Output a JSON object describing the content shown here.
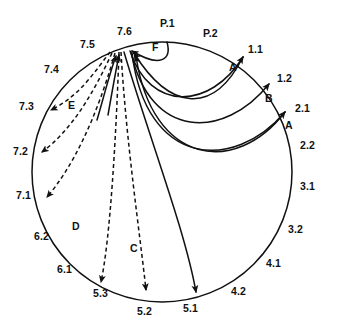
{
  "diagram": {
    "type": "circular-connection-diagram",
    "background_color": "#ffffff",
    "stroke_color": "#111111",
    "circle": {
      "cx": 162,
      "cy": 172,
      "r": 130
    },
    "rim_labels": [
      {
        "id": "P.1",
        "text": "P.1",
        "x": 160,
        "y": 18
      },
      {
        "id": "P.2",
        "text": "P.2",
        "x": 203,
        "y": 28
      },
      {
        "id": "1.1",
        "text": "1.1",
        "x": 248,
        "y": 44
      },
      {
        "id": "1.2",
        "text": "1.2",
        "x": 277,
        "y": 73
      },
      {
        "id": "2.1",
        "text": "2.1",
        "x": 295,
        "y": 103
      },
      {
        "id": "2.2",
        "text": "2.2",
        "x": 300,
        "y": 140
      },
      {
        "id": "3.1",
        "text": "3.1",
        "x": 300,
        "y": 181
      },
      {
        "id": "3.2",
        "text": "3.2",
        "x": 288,
        "y": 224
      },
      {
        "id": "4.1",
        "text": "4.1",
        "x": 266,
        "y": 258
      },
      {
        "id": "4.2",
        "text": "4.2",
        "x": 231,
        "y": 286
      },
      {
        "id": "5.1",
        "text": "5.1",
        "x": 183,
        "y": 303
      },
      {
        "id": "5.2",
        "text": "5.2",
        "x": 137,
        "y": 306
      },
      {
        "id": "5.3",
        "text": "5.3",
        "x": 93,
        "y": 288
      },
      {
        "id": "6.1",
        "text": "6.1",
        "x": 57,
        "y": 264
      },
      {
        "id": "6.2",
        "text": "6.2",
        "x": 34,
        "y": 231
      },
      {
        "id": "7.1",
        "text": "7.1",
        "x": 16,
        "y": 190
      },
      {
        "id": "7.2",
        "text": "7.2",
        "x": 13,
        "y": 146
      },
      {
        "id": "7.3",
        "text": "7.3",
        "x": 19,
        "y": 101
      },
      {
        "id": "7.4",
        "text": "7.4",
        "x": 44,
        "y": 64
      },
      {
        "id": "7.5",
        "text": "7.5",
        "x": 80,
        "y": 39
      },
      {
        "id": "7.6",
        "text": "7.6",
        "x": 117,
        "y": 26
      }
    ],
    "arc_labels": [
      {
        "id": "F",
        "text": "F",
        "x": 152,
        "y": 42
      },
      {
        "id": "A-upper",
        "text": "A",
        "x": 229,
        "y": 62
      },
      {
        "id": "B",
        "text": "B",
        "x": 265,
        "y": 93
      },
      {
        "id": "A-lower",
        "text": "A",
        "x": 285,
        "y": 120
      },
      {
        "id": "E",
        "text": "E",
        "x": 68,
        "y": 100
      },
      {
        "id": "D",
        "text": "D",
        "x": 72,
        "y": 221
      },
      {
        "id": "C",
        "text": "C",
        "x": 130,
        "y": 243
      }
    ],
    "connections": [
      {
        "id": "F",
        "style": "solid",
        "from": "P.1",
        "to": "7.6",
        "direction": "into-hub"
      },
      {
        "id": "A-upper",
        "style": "solid",
        "from": "7.6",
        "to": "1.1",
        "direction": "out-of-hub"
      },
      {
        "id": "B",
        "style": "solid",
        "from": "7.6",
        "to": "1.2",
        "direction": "out-of-hub"
      },
      {
        "id": "A-lower",
        "style": "solid",
        "from": "7.6",
        "to": "2.1",
        "direction": "out-of-hub"
      },
      {
        "id": "into-hub-upper",
        "style": "solid",
        "from": "1.1",
        "to": "7.6",
        "direction": "into-hub"
      },
      {
        "id": "into-hub-lower",
        "style": "solid",
        "from": "2.1",
        "to": "7.6",
        "direction": "into-hub"
      },
      {
        "id": "hub-to-5.1",
        "style": "solid",
        "from": "7.6",
        "to": "5.1",
        "direction": "out-of-hub"
      },
      {
        "id": "C-left",
        "style": "dashed",
        "from": "7.6",
        "to": "5.3",
        "direction": "out-of-hub"
      },
      {
        "id": "C-right",
        "style": "dashed",
        "from": "7.6",
        "to": "5.2",
        "direction": "out-of-hub"
      },
      {
        "id": "D",
        "style": "dashed",
        "from": "7.6",
        "to": "7.1",
        "direction": "out-of-hub"
      },
      {
        "id": "E-mid",
        "style": "dashed",
        "from": "7.6",
        "to": "7.2",
        "direction": "out-of-hub"
      },
      {
        "id": "E-top",
        "style": "dashed",
        "from": "7.6",
        "to": "7.3",
        "direction": "out-of-hub"
      },
      {
        "id": "hub-arrow-1",
        "style": "solid",
        "from": "lower-left",
        "to": "7.6",
        "direction": "into-hub"
      },
      {
        "id": "hub-arrow-2",
        "style": "solid",
        "from": "lower-left",
        "to": "7.6",
        "direction": "into-hub"
      }
    ]
  }
}
